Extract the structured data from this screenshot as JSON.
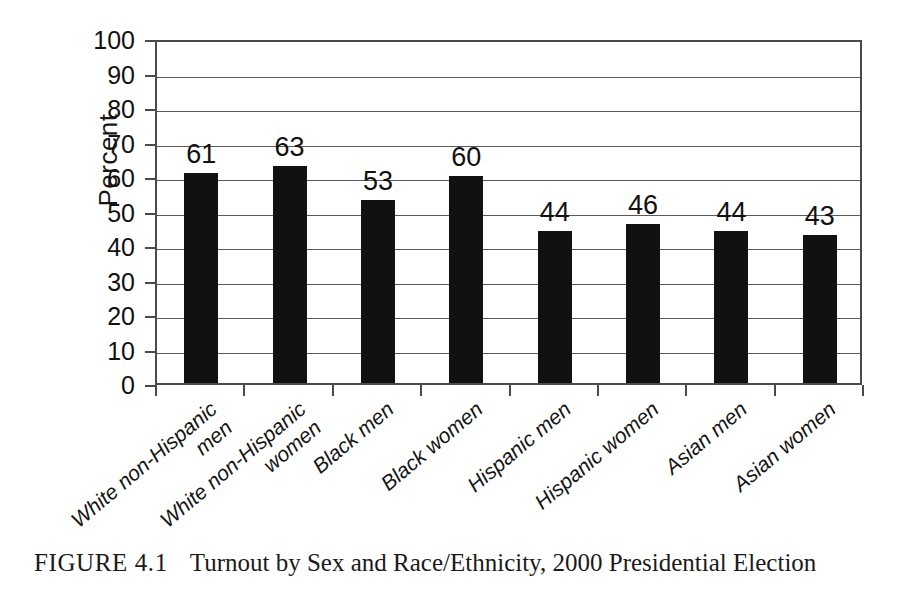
{
  "figure": {
    "caption_label": "FIGURE 4.1",
    "caption_text": "Turnout by Sex and Race/Ethnicity, 2000 Presidential Election"
  },
  "chart_data": {
    "type": "bar",
    "title": "",
    "xlabel": "",
    "ylabel": "Percent",
    "ylim": [
      0,
      100
    ],
    "ytick_step": 10,
    "grid": true,
    "legend": "none",
    "bar_color": "#111111",
    "categories": [
      "White non-Hispanic men",
      "White non-Hispanic women",
      "Black men",
      "Black women",
      "Hispanic men",
      "Hispanic women",
      "Asian men",
      "Asian women"
    ],
    "category_lines": [
      [
        "White non-Hispanic",
        "men"
      ],
      [
        "White non-Hispanic",
        "women"
      ],
      [
        "Black men"
      ],
      [
        "Black women"
      ],
      [
        "Hispanic men"
      ],
      [
        "Hispanic women"
      ],
      [
        "Asian men"
      ],
      [
        "Asian women"
      ]
    ],
    "values": [
      61,
      63,
      53,
      60,
      44,
      46,
      44,
      43
    ],
    "value_labels": [
      "61",
      "63",
      "53",
      "60",
      "44",
      "46",
      "44",
      "43"
    ],
    "yticks": [
      0,
      10,
      20,
      30,
      40,
      50,
      60,
      70,
      80,
      90,
      100
    ],
    "ytick_labels": [
      "0",
      "10",
      "20",
      "30",
      "40",
      "50",
      "60",
      "70",
      "80",
      "90",
      "100"
    ]
  }
}
